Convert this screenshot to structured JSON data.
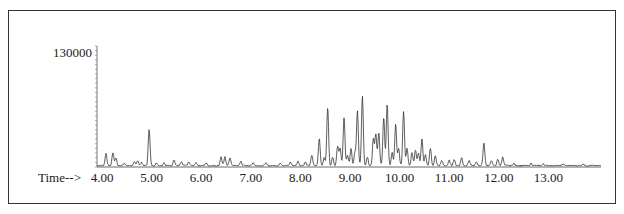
{
  "chart_data": {
    "type": "line",
    "title": "",
    "xlabel": "Time-->",
    "ylabel": "",
    "xlim": [
      4.0,
      14.0
    ],
    "ylim": [
      0,
      130000
    ],
    "y_tick_labels": [
      "130000"
    ],
    "x_ticks": [
      4.0,
      5.0,
      6.0,
      7.0,
      8.0,
      9.0,
      10.0,
      11.0,
      12.0,
      13.0
    ],
    "x_tick_labels": [
      "4.00",
      "5.00",
      "6.00",
      "7.00",
      "8.00",
      "9.00",
      "10.00",
      "11.00",
      "12.00",
      "13.00"
    ],
    "grid": false,
    "legend": null,
    "series": [
      {
        "name": "TIC",
        "peaks": [
          [
            4.08,
            14000
          ],
          [
            4.22,
            15000
          ],
          [
            4.28,
            9000
          ],
          [
            4.45,
            3000
          ],
          [
            4.65,
            4000
          ],
          [
            4.72,
            6000
          ],
          [
            4.8,
            3500
          ],
          [
            4.95,
            42000
          ],
          [
            5.1,
            3000
          ],
          [
            5.25,
            3500
          ],
          [
            5.45,
            7000
          ],
          [
            5.6,
            4000
          ],
          [
            5.75,
            4000
          ],
          [
            5.9,
            3500
          ],
          [
            6.1,
            3000
          ],
          [
            6.4,
            10000
          ],
          [
            6.48,
            10000
          ],
          [
            6.58,
            9000
          ],
          [
            6.8,
            5000
          ],
          [
            7.05,
            3500
          ],
          [
            7.3,
            3000
          ],
          [
            7.6,
            3000
          ],
          [
            7.8,
            4000
          ],
          [
            7.95,
            5000
          ],
          [
            8.1,
            4000
          ],
          [
            8.23,
            12000
          ],
          [
            8.38,
            31000
          ],
          [
            8.48,
            9000
          ],
          [
            8.55,
            67000
          ],
          [
            8.65,
            10000
          ],
          [
            8.75,
            22000
          ],
          [
            8.8,
            20000
          ],
          [
            8.88,
            55000
          ],
          [
            8.95,
            12000
          ],
          [
            9.02,
            19000
          ],
          [
            9.1,
            15000
          ],
          [
            9.15,
            62000
          ],
          [
            9.25,
            80000
          ],
          [
            9.35,
            10000
          ],
          [
            9.47,
            30000
          ],
          [
            9.52,
            36000
          ],
          [
            9.58,
            38000
          ],
          [
            9.68,
            55000
          ],
          [
            9.75,
            70000
          ],
          [
            9.85,
            15000
          ],
          [
            9.92,
            47000
          ],
          [
            9.98,
            20000
          ],
          [
            10.08,
            62000
          ],
          [
            10.15,
            20000
          ],
          [
            10.25,
            15000
          ],
          [
            10.32,
            18000
          ],
          [
            10.38,
            14000
          ],
          [
            10.45,
            30000
          ],
          [
            10.52,
            12000
          ],
          [
            10.62,
            20000
          ],
          [
            10.72,
            11000
          ],
          [
            10.85,
            6000
          ],
          [
            11.0,
            6000
          ],
          [
            11.1,
            7000
          ],
          [
            11.25,
            9000
          ],
          [
            11.4,
            6000
          ],
          [
            11.55,
            4000
          ],
          [
            11.7,
            26000
          ],
          [
            11.85,
            6000
          ],
          [
            11.98,
            7000
          ],
          [
            12.08,
            10000
          ],
          [
            12.3,
            2500
          ],
          [
            12.65,
            2500
          ],
          [
            12.9,
            2000
          ],
          [
            13.3,
            2000
          ],
          [
            13.7,
            2000
          ]
        ]
      }
    ]
  },
  "axis": {
    "y_top_label": "130000",
    "x_prefix": "Time-->"
  }
}
